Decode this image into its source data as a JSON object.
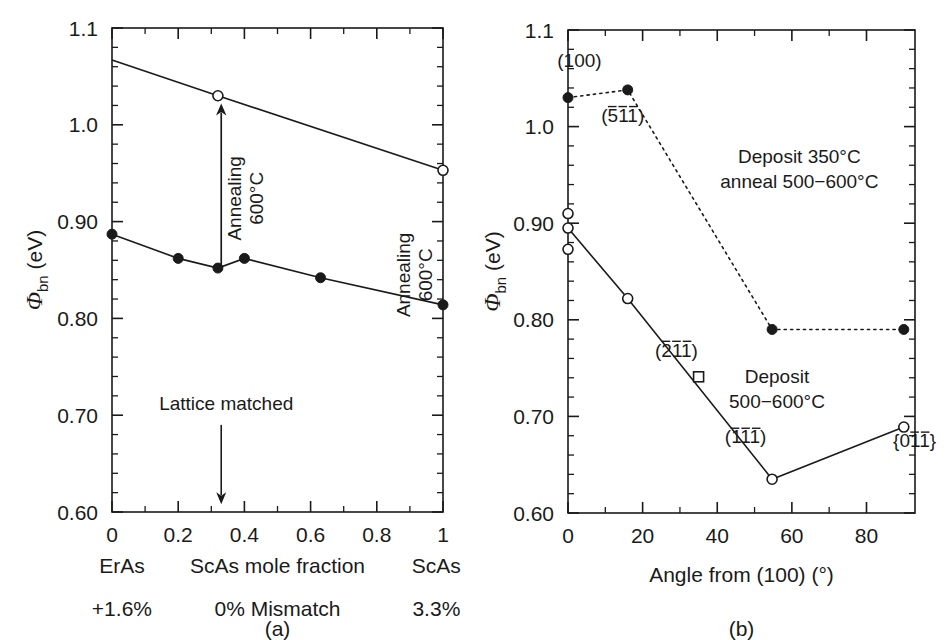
{
  "figure": {
    "background": "#ffffff",
    "ink": "#1a1a1a",
    "panel_a_caption": "(a)",
    "panel_b_caption": "(b)"
  },
  "chart_data": [
    {
      "type": "line",
      "panel": "a",
      "title": "",
      "xlabel": "ScAs mole fraction",
      "ylabel": "Φbn (eV)",
      "ylabel_symbol": "Φ",
      "ylabel_subscript": "bn",
      "ylabel_units": "(eV)",
      "xlim": [
        0,
        1
      ],
      "ylim": [
        0.6,
        1.1
      ],
      "grid": false,
      "legend": "none",
      "xticks": [
        0,
        0.2,
        0.4,
        0.6,
        0.8,
        1
      ],
      "xticklabels": [
        "0",
        "0.2",
        "0.4",
        "0.6",
        "0.8",
        "1"
      ],
      "yticks": [
        0.6,
        0.7,
        0.8,
        0.9,
        1.0,
        1.1
      ],
      "yticklabels": [
        "0.60",
        "0.70",
        "0.80",
        "0.90",
        "1.0",
        "1.1"
      ],
      "y_minor_count": 4,
      "x_minor_count": 1,
      "series": [
        {
          "name": "Annealed 600 °C",
          "marker": "open-circle",
          "linestyle": "solid",
          "x": [
            0,
            0.32,
            1
          ],
          "y": [
            1.067,
            1.03,
            0.953
          ],
          "marker_at": [
            false,
            true,
            true
          ]
        },
        {
          "name": "As-deposited",
          "marker": "filled-circle",
          "linestyle": "solid",
          "x": [
            0,
            0.2,
            0.32,
            0.4,
            0.63,
            1
          ],
          "y": [
            0.887,
            0.862,
            0.852,
            0.862,
            0.842,
            0.814
          ],
          "marker_at": [
            true,
            true,
            true,
            true,
            true,
            true
          ]
        }
      ],
      "annotations": [
        {
          "name": "annealing-arrow-center",
          "text": "Annealing\n600°C",
          "line1": "Annealing",
          "line2": "600°C",
          "rotation": -90,
          "x": 0.33,
          "arrow_from_y": 0.855,
          "arrow_to_y": 1.022
        },
        {
          "name": "annealing-right",
          "line1": "Annealing",
          "line2": "600°C",
          "rotation": -90,
          "x": 0.9
        },
        {
          "name": "lattice-matched",
          "text": "Lattice matched",
          "x": 0.33,
          "y_text": 0.705,
          "arrow_from_y": 0.69,
          "arrow_to_y": 0.608
        }
      ],
      "footer": {
        "left_material": "ErAs",
        "center_material": "ScAs mole fraction",
        "right_material": "ScAs",
        "left_mismatch": "+1.6%",
        "center_mismatch": "0% Mismatch",
        "right_mismatch": "3.3%"
      }
    },
    {
      "type": "line",
      "panel": "b",
      "title": "",
      "xlabel": "Angle from (100) (°)",
      "ylabel": "Φbn (eV)",
      "ylabel_symbol": "Φ",
      "ylabel_subscript": "bn",
      "ylabel_units": "(eV)",
      "xlim": [
        0,
        93
      ],
      "ylim": [
        0.6,
        1.1
      ],
      "grid": false,
      "legend": "none",
      "xticks": [
        0,
        20,
        40,
        60,
        80
      ],
      "xticklabels": [
        "0",
        "20",
        "40",
        "60",
        "80"
      ],
      "yticks": [
        0.6,
        0.7,
        0.8,
        0.9,
        1.0,
        1.1
      ],
      "yticklabels": [
        "0.60",
        "0.70",
        "0.80",
        "0.90",
        "1.0",
        "1.1"
      ],
      "y_minor_count": 4,
      "x_minor_count": 1,
      "series": [
        {
          "name": "Deposit 350°C anneal 500−600°C",
          "marker": "filled-circle",
          "linestyle": "dotted",
          "x": [
            0,
            16,
            54.7,
            90
          ],
          "y": [
            1.03,
            1.038,
            0.79,
            0.79
          ]
        },
        {
          "name": "Deposit 500−600°C",
          "marker": "open-circle",
          "linestyle": "solid",
          "x": [
            0,
            16,
            54.7,
            90
          ],
          "y": [
            0.895,
            0.822,
            0.635,
            0.689
          ]
        },
        {
          "name": "extra open circles at 0°",
          "marker": "open-circle",
          "linestyle": "none",
          "x": [
            0,
            0
          ],
          "y": [
            0.91,
            0.873
          ]
        },
        {
          "name": "(2̅1̅1̅) square",
          "marker": "open-square",
          "linestyle": "none",
          "x": [
            35
          ],
          "y": [
            0.741
          ]
        }
      ],
      "annotations": [
        {
          "name": "label-100",
          "text": "(100)",
          "x": 2,
          "y": 1.062
        },
        {
          "name": "label-511",
          "text": "(5̅11)",
          "html": "(<span class=\"ovr\">5</span>11)",
          "x": 12,
          "y": 1.005
        },
        {
          "name": "label-211",
          "text": "(2̅1̅1̅)",
          "x": 28,
          "y": 0.762
        },
        {
          "name": "label-111",
          "text": "(1̅1̅1̅)",
          "x": 46,
          "y": 0.672
        },
        {
          "name": "label-011",
          "text": "{01̅1̅}",
          "x": 87,
          "y": 0.668
        },
        {
          "name": "deposit-anneal-note",
          "line1": "Deposit 350°C",
          "line2": "anneal 500−600°C",
          "x": 62,
          "y": 0.962
        },
        {
          "name": "deposit-note",
          "line1": "Deposit",
          "line2": "500−600°C",
          "x": 56,
          "y": 0.735
        }
      ]
    }
  ]
}
